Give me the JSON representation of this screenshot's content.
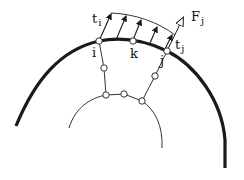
{
  "diagram": {
    "type": "mechanics-contact-traction-diagram",
    "labels": {
      "t_i": {
        "base": "t",
        "sub": "i"
      },
      "t_j": {
        "base": "t",
        "sub": "j"
      },
      "F_j": {
        "base": "F",
        "sub": "j"
      },
      "node_i": "i",
      "node_k": "k",
      "node_j": "j"
    },
    "nodes": [
      {
        "id": "i",
        "x": 99,
        "y": 41
      },
      {
        "id": "k",
        "x": 133,
        "y": 41
      },
      {
        "id": "j",
        "x": 167,
        "y": 51
      },
      {
        "id": "m1",
        "x": 104,
        "y": 68
      },
      {
        "id": "m2",
        "x": 155,
        "y": 76
      },
      {
        "id": "b1",
        "x": 106,
        "y": 95
      },
      {
        "id": "b2",
        "x": 124,
        "y": 94
      },
      {
        "id": "b3",
        "x": 142,
        "y": 101
      }
    ],
    "colors": {
      "stroke": "#1a1a1a",
      "background": "#ffffff"
    }
  }
}
